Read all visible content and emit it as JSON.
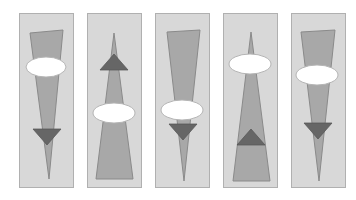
{
  "figure": {
    "title": "",
    "background_color": "#ffffff",
    "width": 356,
    "height": 200,
    "panel_count": 5
  },
  "colors": {
    "background": "#ffffff",
    "panel_fill": "#d8d8d8",
    "panel_stroke": "#b0b0b0",
    "cone_fill": "#a8a8a8",
    "cone_stroke": "#8a8a8a",
    "ellipse_fill": "#ffffff",
    "ellipse_stroke": "#b5b5b5",
    "triangle_fill": "#666666",
    "triangle_stroke": "#555555"
  },
  "panels": [
    {
      "id": "panel-1",
      "index": 1,
      "x": 19,
      "y": 13,
      "width": 55,
      "height": 175,
      "cone": {
        "direction": "down",
        "apex_x": 30,
        "apex_y": 166,
        "top_left_x": 11,
        "top_left_y": 20,
        "top_right_x": 44,
        "top_right_y": 17
      },
      "ellipse": {
        "cx": 27,
        "cy": 54,
        "rx": 20,
        "ry": 10
      },
      "triangle": {
        "direction": "down",
        "cx": 28,
        "cy": 124,
        "half_width": 14,
        "height": 16
      }
    },
    {
      "id": "panel-2",
      "index": 2,
      "x": 87,
      "y": 13,
      "width": 55,
      "height": 175,
      "cone": {
        "direction": "up",
        "apex_x": 27,
        "apex_y": 20,
        "bottom_left_x": 9,
        "bottom_left_y": 166,
        "bottom_right_x": 46,
        "bottom_right_y": 166
      },
      "ellipse": {
        "cx": 27,
        "cy": 100,
        "rx": 21,
        "ry": 10
      },
      "triangle": {
        "direction": "up",
        "cx": 27,
        "cy": 49,
        "half_width": 14,
        "height": 16
      }
    },
    {
      "id": "panel-3",
      "index": 3,
      "x": 155,
      "y": 13,
      "width": 55,
      "height": 175,
      "cone": {
        "direction": "down",
        "apex_x": 29,
        "apex_y": 168,
        "top_left_x": 12,
        "top_left_y": 19,
        "top_right_x": 45,
        "top_right_y": 17
      },
      "ellipse": {
        "cx": 27,
        "cy": 97,
        "rx": 21,
        "ry": 10
      },
      "triangle": {
        "direction": "down",
        "cx": 28,
        "cy": 119,
        "half_width": 14,
        "height": 16
      }
    },
    {
      "id": "panel-4",
      "index": 4,
      "x": 223,
      "y": 13,
      "width": 55,
      "height": 175,
      "cone": {
        "direction": "up",
        "apex_x": 28,
        "apex_y": 19,
        "bottom_left_x": 10,
        "bottom_left_y": 168,
        "bottom_right_x": 47,
        "bottom_right_y": 168
      },
      "ellipse": {
        "cx": 27,
        "cy": 51,
        "rx": 21,
        "ry": 10
      },
      "triangle": {
        "direction": "up",
        "cx": 28,
        "cy": 124,
        "half_width": 14,
        "height": 16
      }
    },
    {
      "id": "panel-5",
      "index": 5,
      "x": 291,
      "y": 13,
      "width": 55,
      "height": 175,
      "cone": {
        "direction": "down",
        "apex_x": 28,
        "apex_y": 168,
        "top_left_x": 10,
        "top_left_y": 19,
        "top_right_x": 44,
        "top_right_y": 17
      },
      "ellipse": {
        "cx": 26,
        "cy": 62,
        "rx": 21,
        "ry": 10
      },
      "triangle": {
        "direction": "down",
        "cx": 27,
        "cy": 118,
        "half_width": 14,
        "height": 16
      }
    }
  ]
}
